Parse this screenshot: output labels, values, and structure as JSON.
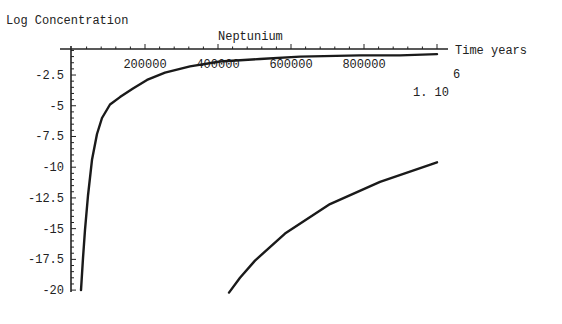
{
  "chart_data": {
    "type": "line",
    "title": "Neptunium",
    "xlabel": "Time years",
    "ylabel": "Log Concentration",
    "x_multiplier_label": {
      "base": "1. 10",
      "exponent": "6"
    },
    "xlim": [
      0,
      1000000
    ],
    "ylim": [
      -20,
      0
    ],
    "x_ticks": [
      200000,
      400000,
      600000,
      800000
    ],
    "x_tick_labels": [
      "200000",
      "400000",
      "600000",
      "800000"
    ],
    "y_ticks": [
      -2.5,
      -5,
      -7.5,
      -10,
      -12.5,
      -15,
      -17.5,
      -20
    ],
    "y_tick_labels": [
      "-2.5",
      "-5",
      "-7.5",
      "-10",
      "-12.5",
      "-15",
      "-17.5",
      "-20"
    ],
    "grid": false,
    "legend": null,
    "series": [
      {
        "name": "curve-1",
        "x": [
          24658,
          30137,
          35616,
          43836,
          54795,
          68493,
          82192,
          104110,
          131507,
          167123,
          205479,
          254795,
          323288,
          405479,
          515068,
          624658,
          789041,
          898630,
          1000000
        ],
        "y": [
          -20.0,
          -17.4,
          -15.1,
          -12.3,
          -9.4,
          -7.3,
          -6.0,
          -4.9,
          -4.3,
          -3.6,
          -2.9,
          -2.3,
          -1.8,
          -1.4,
          -1.2,
          -1.0,
          -0.9,
          -0.9,
          -0.8
        ]
      },
      {
        "name": "curve-2",
        "x": [
          430137,
          460274,
          501370,
          583562,
          706849,
          843836,
          1000000
        ],
        "y": [
          -20.2,
          -19.0,
          -17.6,
          -15.4,
          -13.0,
          -11.2,
          -9.6
        ]
      }
    ]
  }
}
